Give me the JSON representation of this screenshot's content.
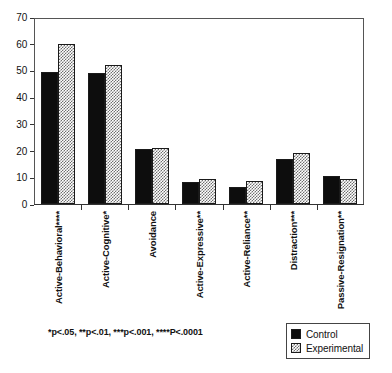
{
  "chart_data": {
    "type": "bar",
    "title": "",
    "subtitle": "",
    "xlabel": "",
    "ylabel": "",
    "ylim": [
      0,
      70
    ],
    "yticks": [
      0,
      10,
      20,
      30,
      40,
      50,
      60,
      70
    ],
    "grid": false,
    "legend_position": "bottom-right",
    "categories": [
      "Active-Behavioral****",
      "Active-Cognitive*",
      "Avoidance",
      "Active-Expressive**",
      "Active-Reliance**",
      "Distraction***",
      "Passive-Resignation**"
    ],
    "series": [
      {
        "name": "Control",
        "color": "#0d0d0d",
        "values": [
          49.5,
          49.0,
          20.6,
          8.3,
          6.5,
          16.8,
          10.5
        ]
      },
      {
        "name": "Experimental",
        "color": "#9a9a9a",
        "values": [
          60.0,
          52.0,
          21.0,
          9.3,
          8.8,
          19.0,
          9.3
        ]
      }
    ],
    "annotations": [
      "*p<.05,  **p<.01,  ***p<.001,  ****P<.0001"
    ]
  },
  "footnote": "*p<.05,  **p<.01,  ***p<.001,  ****P<.0001",
  "legend": {
    "items": [
      {
        "label": "Control",
        "swatch": "control"
      },
      {
        "label": "Experimental",
        "swatch": "experimental"
      }
    ]
  }
}
